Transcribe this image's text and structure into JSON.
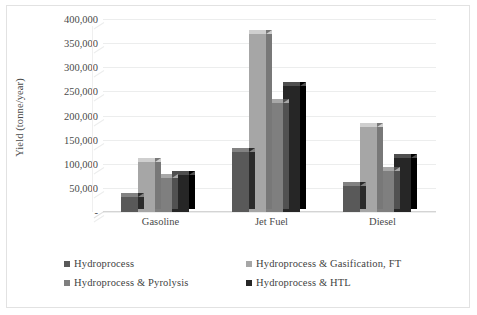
{
  "chart_data": {
    "type": "bar",
    "title": "",
    "subtitle": "",
    "xlabel": "",
    "ylabel": "Yield (tonne/year)",
    "categories": [
      "Gasoline",
      "Jet Fuel",
      "Diesel"
    ],
    "series": [
      {
        "name": "Hydroprocess",
        "color": "#595959",
        "values": [
          33000,
          127000,
          55000
        ]
      },
      {
        "name": "Hydroprocess & Gasification, FT",
        "color": "#a6a6a6",
        "values": [
          105000,
          372000,
          178000
        ]
      },
      {
        "name": "Hydroprocess & Pyrolysis",
        "color": "#7f7f7f",
        "values": [
          72000,
          228000,
          88000
        ]
      },
      {
        "name": "Hydroprocess & HTL",
        "color": "#262626",
        "values": [
          78000,
          263000,
          115000
        ]
      }
    ],
    "ylim": [
      0,
      400000
    ],
    "ytick_values": [
      0,
      50000,
      100000,
      150000,
      200000,
      250000,
      300000,
      350000,
      400000
    ],
    "ytick_labels": [
      "-",
      "50,000",
      "100,000",
      "150,000",
      "200,000",
      "250,000",
      "300,000",
      "350,000",
      "400,000"
    ],
    "grid": true,
    "grid_axis": "y",
    "legend_position": "bottom",
    "style": "3d-clustered-column",
    "background_color": "#ffffff",
    "gridline_color": "#eceded",
    "text_color": "#4a4a4a"
  },
  "legend": {
    "items": [
      {
        "label": "Hydroprocess",
        "color": "#595959"
      },
      {
        "label": "Hydroprocess & Gasification, FT",
        "color": "#a6a6a6"
      },
      {
        "label": "Hydroprocess & Pyrolysis",
        "color": "#7f7f7f"
      },
      {
        "label": "Hydroprocess & HTL",
        "color": "#262626"
      }
    ]
  }
}
